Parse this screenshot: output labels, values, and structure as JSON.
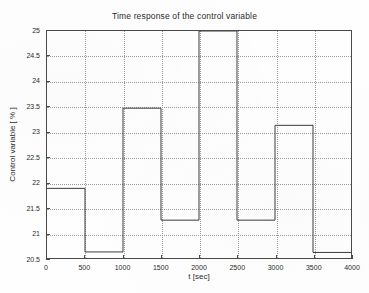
{
  "chart_data": {
    "type": "line",
    "subtype": "step",
    "title": "Time response of the control variable",
    "xlabel": "t [sec]",
    "ylabel": "Control variable [ % ]",
    "xlim": [
      0,
      4000
    ],
    "ylim": [
      20.5,
      25
    ],
    "xticks": [
      0,
      500,
      1000,
      1500,
      2000,
      2500,
      3000,
      3500,
      4000
    ],
    "xtick_labels": [
      "0",
      "500",
      "1000",
      "1500",
      "2000",
      "2500",
      "3000",
      "3500",
      "4000"
    ],
    "yticks": [
      20.5,
      21,
      21.5,
      22,
      22.5,
      23,
      23.5,
      24,
      24.5,
      25
    ],
    "ytick_labels": [
      "20.5",
      "21",
      "21.5",
      "22",
      "22.5",
      "23",
      "23.5",
      "24",
      "24.5",
      "25"
    ],
    "grid": true,
    "grid_style": "dotted",
    "legend": null,
    "line_color": "#3c3c3c",
    "series": [
      {
        "name": "control variable",
        "step_segments": [
          {
            "t_start": 0,
            "t_end": 500,
            "value": 21.88
          },
          {
            "t_start": 500,
            "t_end": 1000,
            "value": 20.62
          },
          {
            "t_start": 1000,
            "t_end": 1500,
            "value": 23.47
          },
          {
            "t_start": 1500,
            "t_end": 2000,
            "value": 21.25
          },
          {
            "t_start": 2000,
            "t_end": 2500,
            "value": 25.0,
            "clipped_at_top": true
          },
          {
            "t_start": 2500,
            "t_end": 3000,
            "value": 21.25
          },
          {
            "t_start": 3000,
            "t_end": 3500,
            "value": 23.13
          },
          {
            "t_start": 3500,
            "t_end": 4000,
            "value": 20.61
          }
        ],
        "x": [
          0,
          500,
          1000,
          1500,
          2000,
          2500,
          3000,
          3500,
          4000
        ],
        "values": [
          21.88,
          20.62,
          23.47,
          21.25,
          25.0,
          21.25,
          23.13,
          20.61,
          20.61
        ]
      }
    ]
  }
}
